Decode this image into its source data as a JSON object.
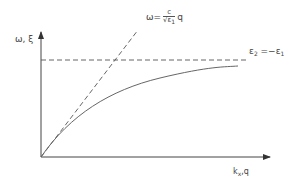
{
  "diagram": {
    "y_axis_label": "ω, ξ",
    "x_axis_label": {
      "base": "k",
      "sub": "x",
      "rest": ",q"
    },
    "light_line": {
      "lhs": "ω=",
      "num": "c",
      "den": "√ε",
      "den_sub": "1",
      "rhs": "q"
    },
    "asymptote": {
      "eps2": "ε",
      "eps2_sub": "2",
      "eq": " =−",
      "eps1": "ε",
      "eps1_sub": "1"
    },
    "colors": {
      "axis": "#444444",
      "curve": "#666666",
      "dashed": "#555555"
    }
  }
}
